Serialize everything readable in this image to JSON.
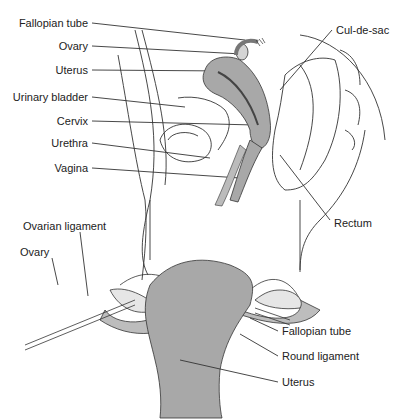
{
  "sagittal_view": {
    "labels": [
      {
        "text": "Fallopian tube",
        "x": 88,
        "y": 23,
        "align": "right"
      },
      {
        "text": "Ovary",
        "x": 88,
        "y": 46,
        "align": "right"
      },
      {
        "text": "Uterus",
        "x": 88,
        "y": 70,
        "align": "right"
      },
      {
        "text": "Urinary bladder",
        "x": 88,
        "y": 97,
        "align": "right"
      },
      {
        "text": "Cervix",
        "x": 88,
        "y": 121,
        "align": "right"
      },
      {
        "text": "Urethra",
        "x": 88,
        "y": 143,
        "align": "right"
      },
      {
        "text": "Vagina",
        "x": 88,
        "y": 168,
        "align": "right"
      },
      {
        "text": "Cul-de-sac",
        "x": 336,
        "y": 30,
        "align": "left"
      },
      {
        "text": "Rectum",
        "x": 334,
        "y": 223,
        "align": "left"
      }
    ]
  },
  "frontal_view": {
    "labels": [
      {
        "text": "Ovarian ligament",
        "x": 23,
        "y": 226,
        "align": "left"
      },
      {
        "text": "Ovary",
        "x": 20,
        "y": 252,
        "align": "left"
      },
      {
        "text": "Fallopian tube",
        "x": 282,
        "y": 331,
        "align": "left"
      },
      {
        "text": "Round ligament",
        "x": 282,
        "y": 356,
        "align": "left"
      },
      {
        "text": "Uterus",
        "x": 282,
        "y": 382,
        "align": "left"
      }
    ]
  },
  "colors": {
    "tissue_gray": "#a8a8a8",
    "light_gray": "#d4d4d4",
    "line": "#222222"
  }
}
